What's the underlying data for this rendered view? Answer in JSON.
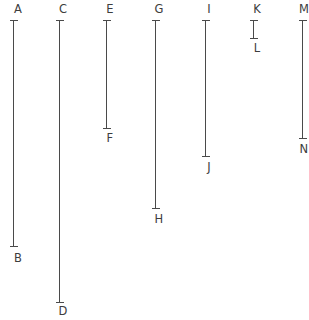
{
  "figure": {
    "type": "line-segment-diagram",
    "width": 309,
    "height": 320,
    "background_color": "#ffffff",
    "stroke_color": "#4a4a4a",
    "label_color": "#3d3d3d",
    "cap_half_width": 4,
    "segments": [
      {
        "id": "AB",
        "x": 13,
        "top_label": "A",
        "bottom_label": "B",
        "y_top": 20,
        "y_bottom": 246,
        "length_px": 226,
        "top_label_x": 7,
        "top_label_y": 3,
        "bottom_label_x": 7,
        "bottom_label_y": 252
      },
      {
        "id": "CD",
        "x": 59,
        "top_label": "C",
        "bottom_label": "D",
        "y_top": 20,
        "y_bottom": 302,
        "length_px": 282,
        "top_label_x": 52,
        "top_label_y": 3,
        "bottom_label_x": 52,
        "bottom_label_y": 305
      },
      {
        "id": "EF",
        "x": 106,
        "top_label": "E",
        "bottom_label": "F",
        "y_top": 20,
        "y_bottom": 128,
        "length_px": 108,
        "top_label_x": 99,
        "top_label_y": 3,
        "bottom_label_x": 99,
        "bottom_label_y": 132
      },
      {
        "id": "GH",
        "x": 155,
        "top_label": "G",
        "bottom_label": "H",
        "y_top": 20,
        "y_bottom": 208,
        "length_px": 188,
        "top_label_x": 148,
        "top_label_y": 3,
        "bottom_label_x": 148,
        "bottom_label_y": 213
      },
      {
        "id": "IJ",
        "x": 205,
        "top_label": "I",
        "bottom_label": "J",
        "y_top": 20,
        "y_bottom": 156,
        "length_px": 136,
        "top_label_x": 198,
        "top_label_y": 3,
        "bottom_label_x": 198,
        "bottom_label_y": 161
      },
      {
        "id": "KL",
        "x": 253,
        "top_label": "K",
        "bottom_label": "L",
        "y_top": 20,
        "y_bottom": 38,
        "length_px": 18,
        "top_label_x": 246,
        "top_label_y": 3,
        "bottom_label_x": 246,
        "bottom_label_y": 42
      },
      {
        "id": "MN",
        "x": 302,
        "top_label": "M",
        "bottom_label": "N",
        "y_top": 20,
        "y_bottom": 138,
        "length_px": 118,
        "top_label_x": 293,
        "top_label_y": 3,
        "bottom_label_x": 293,
        "bottom_label_y": 143
      }
    ]
  }
}
